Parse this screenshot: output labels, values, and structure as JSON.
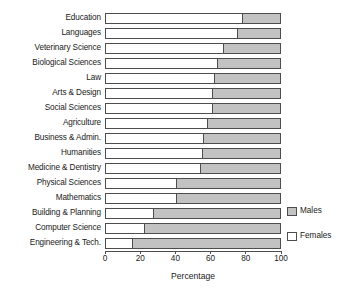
{
  "chart_data": {
    "type": "bar",
    "orientation": "horizontal",
    "stacked": true,
    "title": "",
    "xlabel": "Percentage",
    "ylabel": "",
    "xlim": [
      0,
      100
    ],
    "xticks": [
      0,
      20,
      40,
      60,
      80,
      100
    ],
    "xtick_labels": [
      "0",
      "20",
      "40",
      "60",
      "80",
      "100"
    ],
    "grid": false,
    "legend_position": "right",
    "categories": [
      "Education",
      "Languages",
      "Veterinary Science",
      "Biological Sciences",
      "Law",
      "Arts & Design",
      "Social Sciences",
      "Agriculture",
      "Business & Admin.",
      "Humanities",
      "Medicine & Dentistry",
      "Physical Sciences",
      "Mathematics",
      "Building & Planning",
      "Computer Science",
      "Engineering & Tech."
    ],
    "series": [
      {
        "name": "Females",
        "color": "#ffffff",
        "values": [
          78,
          75,
          67,
          64,
          62,
          61,
          61,
          58,
          56,
          55,
          54,
          40,
          40,
          27,
          22,
          15
        ]
      },
      {
        "name": "Males",
        "color": "#c2c2c2",
        "values": [
          22,
          25,
          33,
          36,
          38,
          39,
          39,
          42,
          44,
          45,
          46,
          60,
          60,
          73,
          78,
          85
        ]
      }
    ]
  },
  "legend": {
    "items": [
      {
        "label": "Males",
        "swatch": "#c2c2c2"
      },
      {
        "label": "Females",
        "swatch": "#ffffff"
      }
    ]
  },
  "axis": {
    "x_title": "Percentage"
  }
}
